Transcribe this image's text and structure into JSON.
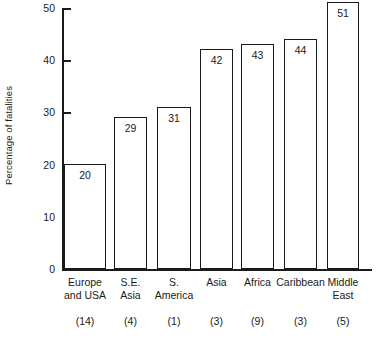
{
  "chart_data": {
    "type": "bar",
    "title": "",
    "subtitle": "",
    "xlabel": "",
    "ylabel": "Percentage of fatalities",
    "ylim": [
      0,
      50
    ],
    "yticks": [
      0,
      10,
      20,
      30,
      40,
      50
    ],
    "ytick_labels": [
      "0",
      "10",
      "20",
      "30",
      "40",
      "50"
    ],
    "grid": false,
    "legend": null,
    "orientation": "vertical",
    "bar_style": {
      "fill": "#ffffff",
      "edge": "#1a1a1a",
      "value_labels_inside_top": true
    },
    "categories": [
      "Europe and USA",
      "S.E. Asia",
      "S. America",
      "Asia",
      "Africa",
      "Caribbean",
      "Middle East"
    ],
    "category_lines": [
      [
        "Europe",
        "and USA"
      ],
      [
        "S.E.",
        "Asia"
      ],
      [
        "S.",
        "America"
      ],
      [
        "Asia",
        ""
      ],
      [
        "Africa",
        ""
      ],
      [
        "Caribbean",
        ""
      ],
      [
        "Middle",
        "East"
      ]
    ],
    "values": [
      20,
      29,
      31,
      42,
      43,
      44,
      51
    ],
    "value_labels": [
      "20",
      "29",
      "31",
      "42",
      "43",
      "44",
      "51"
    ],
    "sample_counts": [
      14,
      4,
      1,
      3,
      9,
      3,
      5
    ],
    "sample_count_labels": [
      "(14)",
      "(4)",
      "(1)",
      "(3)",
      "(9)",
      "(3)",
      "(5)"
    ]
  }
}
